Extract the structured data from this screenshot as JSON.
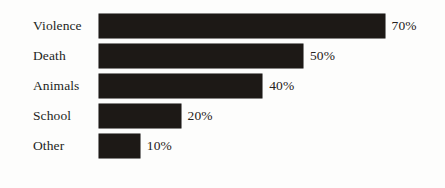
{
  "chart_data": {
    "type": "bar",
    "orientation": "horizontal",
    "title": "",
    "subtitle": "",
    "xlabel": "",
    "ylabel": "",
    "categories": [
      "Violence",
      "Death",
      "Animals",
      "School",
      "Other"
    ],
    "values": [
      70,
      50,
      40,
      20,
      10
    ],
    "value_labels": [
      "70%",
      "50%",
      "40%",
      "20%",
      "10%"
    ],
    "value_unit": "%",
    "xlim": [
      0,
      100
    ],
    "grid": false,
    "axis_visible": false,
    "tick_labels": [],
    "legend": [],
    "legend_position": "none",
    "annotations": [],
    "bar_color": "#1d1916",
    "background_color": "#fdfdfc",
    "text_color": "#231f1c",
    "px_per_percent": 4.08,
    "bars": [
      {
        "category": "Violence",
        "value": 70,
        "label": "70%"
      },
      {
        "category": "Death",
        "value": 50,
        "label": "50%"
      },
      {
        "category": "Animals",
        "value": 40,
        "label": "40%"
      },
      {
        "category": "School",
        "value": 20,
        "label": "20%"
      },
      {
        "category": "Other",
        "value": 10,
        "label": "10%"
      }
    ]
  }
}
